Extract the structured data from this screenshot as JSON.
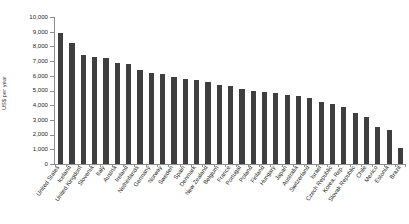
{
  "chart_data": {
    "type": "bar",
    "title": "",
    "xlabel": "",
    "ylabel": "US$ per year",
    "ylim": [
      0,
      10000
    ],
    "ytick_values": [
      0,
      1000,
      2000,
      3000,
      4000,
      5000,
      6000,
      7000,
      8000,
      9000,
      10000
    ],
    "ytick_labels": [
      "0",
      "1,000",
      "2,000",
      "3,000",
      "4,000",
      "5,000",
      "6,000",
      "7,000",
      "8,000",
      "9,000",
      "10,000"
    ],
    "grid": false,
    "legend": "none",
    "bar_color": "#3f3f3f",
    "categories": [
      "United States",
      "Iceland",
      "United Kingdom",
      "Slovenia",
      "Italy",
      "Austria",
      "Ireland",
      "Netherlands",
      "Germany",
      "Norway",
      "Sweden",
      "Spain",
      "Denmark",
      "New Zealand",
      "Belgium",
      "France",
      "Portugal",
      "Poland",
      "Finland",
      "Hungary",
      "Japan",
      "Australia",
      "Switzerland",
      "Israel",
      "Czech Republic",
      "Korea, Rep.",
      "Slovak Republic",
      "Chile",
      "Mexico",
      "Estonia",
      "Brazil"
    ],
    "values": [
      8900,
      8200,
      7400,
      7300,
      7200,
      6900,
      6800,
      6400,
      6200,
      6100,
      5900,
      5800,
      5700,
      5600,
      5400,
      5300,
      5100,
      5000,
      4900,
      4800,
      4700,
      4600,
      4500,
      4200,
      4100,
      3900,
      3500,
      3200,
      2500,
      2300,
      1100
    ]
  }
}
